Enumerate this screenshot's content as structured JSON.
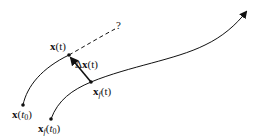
{
  "diagram": {
    "type": "trajectory-deviation",
    "colors": {
      "stroke": "#111111",
      "background": "#ffffff"
    },
    "labels": {
      "x_t": {
        "bold": "x",
        "rest": "(t)"
      },
      "x_t0": {
        "bold": "x",
        "open": "(",
        "var": "t",
        "sub": "0",
        "close": ")"
      },
      "xf_t": {
        "bold": "x",
        "sub": "f",
        "rest": "(t)"
      },
      "xf_t0": {
        "bold": "x",
        "sub": "f",
        "open": "(",
        "var": "t",
        "sub2": "0",
        "close": ")"
      },
      "delta": {
        "sym": "Δ",
        "bold": "x",
        "rest": "(t)"
      },
      "question": "?"
    },
    "points": {
      "x_t0": [
        23,
        105
      ],
      "x_t": [
        69,
        55
      ],
      "xf_t0": [
        51,
        119
      ],
      "xf_t": [
        91,
        82
      ],
      "question_end": [
        115,
        29
      ],
      "arrow_end": [
        247,
        11
      ]
    },
    "curves": [
      {
        "name": "perturbed-trajectory",
        "style": "solid",
        "from": "x_t0",
        "to": "x_t"
      },
      {
        "name": "perturbed-extrapolation",
        "style": "dashed",
        "from": "x_t",
        "to": "question_end"
      },
      {
        "name": "reference-trajectory",
        "style": "solid-arrow",
        "from": "xf_t0",
        "to": "arrow_end"
      },
      {
        "name": "deviation-vector",
        "style": "arrow",
        "from": "xf_t",
        "to": "x_t"
      }
    ]
  }
}
